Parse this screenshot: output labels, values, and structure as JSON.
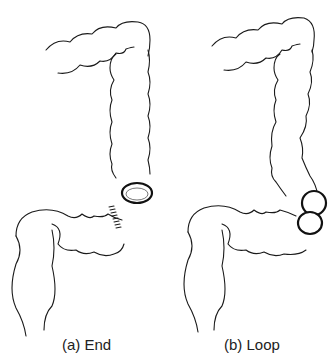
{
  "figure": {
    "panels": [
      {
        "id": "a",
        "caption": "(a) End",
        "structure": "colon",
        "stoma_type": "end-stoma",
        "features": [
          "single-stoma-opening",
          "sutured-distal-end"
        ]
      },
      {
        "id": "b",
        "caption": "(b) Loop",
        "structure": "colon",
        "stoma_type": "loop-stoma",
        "features": [
          "double-barrel-stoma-openings"
        ]
      }
    ],
    "colors": {
      "line": "#1a1a1a",
      "background": "#ffffff"
    }
  }
}
